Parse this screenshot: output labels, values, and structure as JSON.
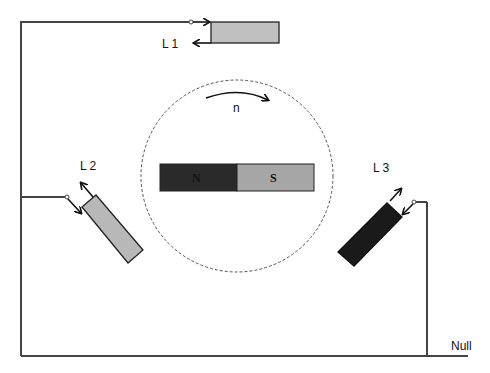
{
  "diagram": {
    "type": "three-phase generator schematic",
    "rotor": {
      "north_label": "N",
      "south_label": "S",
      "rotation_label": "n",
      "north_color": "#2a2a2a",
      "south_color": "#a6a6a6"
    },
    "coils": [
      {
        "id": "L1",
        "label": "L 1",
        "color": "#c0c0c0"
      },
      {
        "id": "L2",
        "label": "L 2",
        "color": "#b8b8b8"
      },
      {
        "id": "L3",
        "label": "L 3",
        "color": "#1a1a1a"
      }
    ],
    "neutral_label": "Null",
    "wire_color": "#444444"
  }
}
